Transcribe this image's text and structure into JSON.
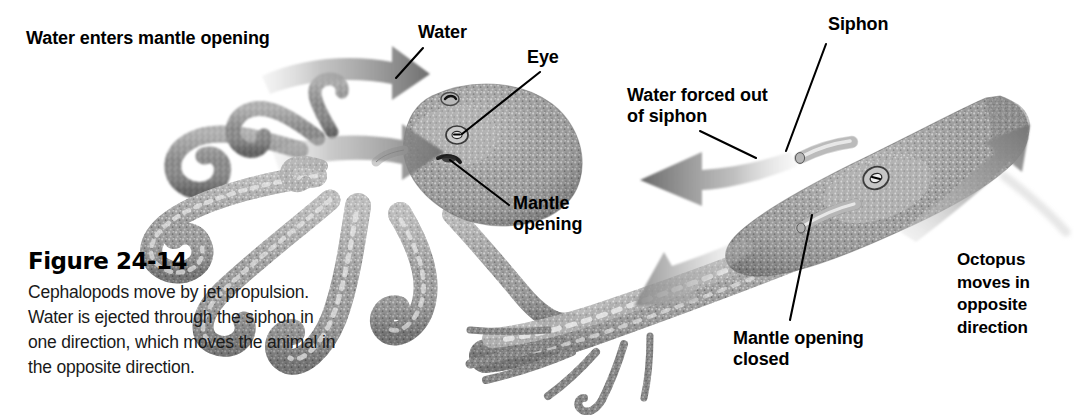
{
  "figure": {
    "title": "Figure 24-14",
    "caption": "Cephalopods move by jet propulsion.\nWater is ejected through the siphon in\none direction, which moves the animal in\nthe opposite direction.",
    "background_color": "#ffffff",
    "text_color": "#000000",
    "arrow_color": "#7d7d7d",
    "leader_color": "#000000"
  },
  "labels": {
    "water_enters_mantle_opening": "Water enters mantle opening",
    "water": "Water",
    "eye": "Eye",
    "mantle_opening": "Mantle\nopening",
    "water_forced_out_of_siphon": "Water forced out\nof siphon",
    "siphon": "Siphon",
    "mantle_opening_closed": "Mantle opening\nclosed",
    "octopus_moves_in_opposite_direction": "Octopus\nmoves in\nopposite\ndirection"
  },
  "panels": [
    {
      "name": "left-panel",
      "description": "Octopus with mantle opening expanded, water entering",
      "state": "mantle opening open, water drawn in"
    },
    {
      "name": "right-panel",
      "description": "Octopus elongated, jetting forward with siphon expelling water",
      "state": "mantle opening closed, water forced out of siphon"
    }
  ],
  "arrows": [
    {
      "name": "water-in-arrow-upper",
      "direction": "right",
      "meaning": "Water enters mantle opening"
    },
    {
      "name": "water-in-arrow-lower",
      "direction": "right",
      "meaning": "Water enters mantle opening"
    },
    {
      "name": "water-out-arrow-upper",
      "direction": "left",
      "meaning": "Water forced out of siphon"
    },
    {
      "name": "water-out-arrow-lower",
      "direction": "left",
      "meaning": "Water forced out of siphon"
    },
    {
      "name": "octopus-motion-arrow",
      "direction": "up-right",
      "meaning": "Octopus moves in opposite direction"
    }
  ]
}
